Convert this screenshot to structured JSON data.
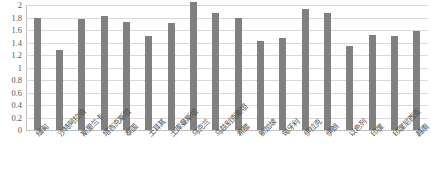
{
  "chart_data": {
    "type": "bar",
    "title": "",
    "subtitle": "",
    "xlabel": "",
    "ylabel": "",
    "ylim": [
      0,
      2
    ],
    "grid": true,
    "legend": "none",
    "bar_color": "#808080",
    "grid_color": "#d9d9d9",
    "y_ticks": [
      "2",
      "1.8",
      "1.6",
      "1.4",
      "1.2",
      "1",
      "0.8",
      "0.6",
      "0.4",
      "0.2",
      "0"
    ],
    "y_tick_values": [
      2,
      1.8,
      1.6,
      1.4,
      1.2,
      1,
      0.8,
      0.6,
      0.4,
      0.2,
      0
    ],
    "categories": [
      "缅甸",
      "沙特阿拉伯",
      "斯里兰卡",
      "塔吉克斯坦",
      "泰国",
      "土耳其",
      "土库曼斯坦",
      "乌克兰",
      "乌兹别克斯坦",
      "希腊",
      "新加坡",
      "匈牙利",
      "伊拉克",
      "伊朗",
      "以色列",
      "印度",
      "印度尼西亚",
      "越南"
    ],
    "values": [
      1.8,
      1.28,
      1.77,
      1.82,
      1.73,
      1.5,
      1.72,
      2.05,
      1.88,
      1.8,
      1.42,
      1.47,
      1.93,
      1.87,
      1.35,
      1.52,
      1.5,
      1.58
    ]
  }
}
